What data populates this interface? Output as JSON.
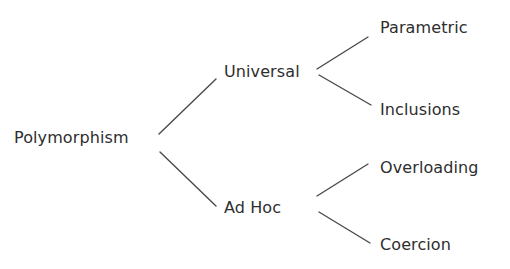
{
  "diagram": {
    "type": "tree",
    "orientation": "left-to-right",
    "root": {
      "id": "polymorphism",
      "label": "Polymorphism",
      "children": [
        {
          "id": "universal",
          "label": "Universal",
          "children": [
            {
              "id": "parametric",
              "label": "Parametric"
            },
            {
              "id": "inclusions",
              "label": "Inclusions"
            }
          ]
        },
        {
          "id": "adhoc",
          "label": "Ad Hoc",
          "children": [
            {
              "id": "overloading",
              "label": "Overloading"
            },
            {
              "id": "coercion",
              "label": "Coercion"
            }
          ]
        }
      ]
    },
    "nodes": {
      "polymorphism": {
        "label": "Polymorphism",
        "x": 14,
        "y": 128
      },
      "universal": {
        "label": "Universal",
        "x": 224,
        "y": 62
      },
      "adhoc": {
        "label": "Ad Hoc",
        "x": 224,
        "y": 198
      },
      "parametric": {
        "label": "Parametric",
        "x": 380,
        "y": 18
      },
      "inclusions": {
        "label": "Inclusions",
        "x": 380,
        "y": 100
      },
      "overloading": {
        "label": "Overloading",
        "x": 380,
        "y": 158
      },
      "coercion": {
        "label": "Coercion",
        "x": 380,
        "y": 235
      }
    },
    "edges": [
      {
        "from": "polymorphism",
        "to": "universal",
        "x1": 159,
        "y1": 134,
        "x2": 216,
        "y2": 79
      },
      {
        "from": "polymorphism",
        "to": "adhoc",
        "x1": 160,
        "y1": 152,
        "x2": 216,
        "y2": 206
      },
      {
        "from": "universal",
        "to": "parametric",
        "x1": 317,
        "y1": 69,
        "x2": 368,
        "y2": 37
      },
      {
        "from": "universal",
        "to": "inclusions",
        "x1": 319,
        "y1": 75,
        "x2": 371,
        "y2": 105
      },
      {
        "from": "adhoc",
        "to": "overloading",
        "x1": 317,
        "y1": 196,
        "x2": 368,
        "y2": 164
      },
      {
        "from": "adhoc",
        "to": "coercion",
        "x1": 319,
        "y1": 212,
        "x2": 370,
        "y2": 243
      }
    ],
    "colors": {
      "text": "#2e2e2e",
      "edge": "#4a4a4a",
      "background": "#ffffff"
    }
  }
}
